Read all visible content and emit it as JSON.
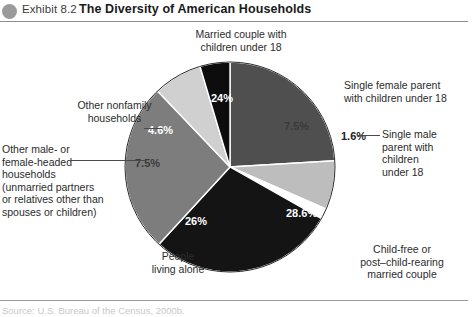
{
  "header": {
    "bullet_icon": "circle-bullet-icon",
    "exhibit_label": "Exhibit 8.2",
    "title": "The Diversity of American Households"
  },
  "footer": {
    "source": "Source: U.S. Bureau of the Census, 2000b."
  },
  "chart_data": {
    "type": "pie",
    "title": "The Diversity of American Households",
    "xlabel": "",
    "ylabel": "",
    "grid": false,
    "legend_position": "callout-labels",
    "start_angle_deg": 0,
    "direction": "clockwise",
    "total": 100,
    "units": "percent",
    "categories": [
      "Married couple with children under 18",
      "Single female parent with children under 18",
      "Single male parent with children under 18",
      "Child-free or post–child-rearing married couple",
      "People living alone",
      "Other male- or female-headed households (unmarried partners or relatives other than spouses or children)",
      "Other nonfamily households"
    ],
    "values": [
      24,
      7.5,
      1.6,
      28.6,
      26,
      7.5,
      4.6
    ],
    "value_labels": [
      "24%",
      "7.5%",
      "1.6%",
      "28.6%",
      "26%",
      "7.5%",
      "4.6%"
    ],
    "colors": [
      "#4f4f4f",
      "#bdbdbd",
      "#ffffff",
      "#141414",
      "#7d7d7d",
      "#d0d0d0",
      "#0d0d0d"
    ],
    "slices": [
      {
        "name": "married-couple-with-children",
        "label": "Married couple with\nchildren under 18",
        "value": 24,
        "value_label": "24%",
        "color": "#4f4f4f",
        "label_color": "#ffffff",
        "has_leader": false
      },
      {
        "name": "single-female-parent",
        "label": "Single female parent\nwith children under 18",
        "value": 7.5,
        "value_label": "7.5%",
        "color": "#bdbdbd",
        "label_color": "#3a3a3a",
        "has_leader": false
      },
      {
        "name": "single-male-parent",
        "label": "Single male\nparent with\nchildren\nunder 18",
        "value": 1.6,
        "value_label": "1.6%",
        "color": "#ffffff",
        "label_color": "#222222",
        "has_leader": true
      },
      {
        "name": "child-free-married-couple",
        "label": "Child-free or\npost–child-rearing\nmarried couple",
        "value": 28.6,
        "value_label": "28.6%",
        "color": "#141414",
        "label_color": "#ffffff",
        "has_leader": false
      },
      {
        "name": "people-living-alone",
        "label": "People\nliving alone",
        "value": 26,
        "value_label": "26%",
        "color": "#7d7d7d",
        "label_color": "#ffffff",
        "has_leader": false
      },
      {
        "name": "other-male-or-female-headed-households",
        "label": "Other male- or\nfemale-headed\nhouseholds\n(unmarried partners\nor relatives other than\nspouses or children)",
        "value": 7.5,
        "value_label": "7.5%",
        "color": "#d0d0d0",
        "label_color": "#3a3a3a",
        "has_leader": true
      },
      {
        "name": "other-nonfamily-households",
        "label": "Other nonfamily\nhouseholds",
        "value": 4.6,
        "value_label": "4.6%",
        "color": "#0d0d0d",
        "label_color": "#ffffff",
        "has_leader": true
      }
    ]
  }
}
